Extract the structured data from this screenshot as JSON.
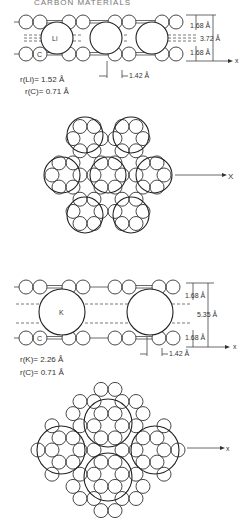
{
  "header": {
    "partial_title": "CARBON MATERIALS"
  },
  "panel_li_side": {
    "intercalant_label": "Li",
    "carbon_label": "C",
    "dim_top": "1.68 Å",
    "dim_mid": "3.72 Å",
    "dim_bottom": "1.68 Å",
    "dim_spacing": "1.42 Å",
    "radius_intercalant": "r(Li)= 1.52 Å",
    "radius_carbon": "r(C)= 0.71 Å",
    "axis_label": "x"
  },
  "panel_li_plan": {
    "axis_label": "X"
  },
  "panel_k_side": {
    "intercalant_label": "K",
    "carbon_label": "C",
    "dim_top": "1.68 Å",
    "dim_mid": "5.35 Å",
    "dim_bottom": "1.68 Å",
    "dim_spacing": "1.42 Å",
    "radius_intercalant": "r(K)= 2.26 Å",
    "radius_carbon": "r(C)= 0.71 Å",
    "axis_label": "x"
  },
  "panel_k_plan": {
    "axis_label": "x"
  },
  "colors": {
    "line": "#333333",
    "background": "#ffffff"
  }
}
